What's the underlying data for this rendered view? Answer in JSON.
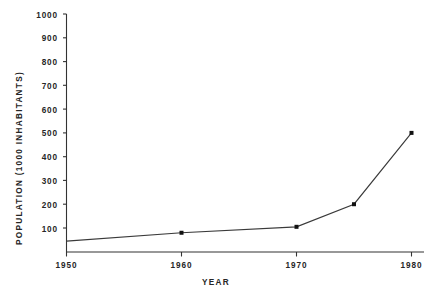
{
  "chart_data": {
    "type": "line",
    "title": "",
    "xlabel": "YEAR",
    "ylabel": "POPULATION  (1000 INHABITANTS)",
    "x": [
      1950,
      1960,
      1970,
      1975,
      1980
    ],
    "values": [
      45,
      80,
      105,
      200,
      500
    ],
    "series": [
      {
        "name": "Population",
        "values": [
          45,
          80,
          105,
          200,
          500
        ]
      }
    ],
    "xlim": [
      1950,
      1980
    ],
    "ylim": [
      0,
      1000
    ],
    "xticks": [
      1950,
      1960,
      1970,
      1980
    ],
    "xtick_labels": [
      "1950",
      "1960",
      "1970",
      "1980"
    ],
    "yticks": [
      100,
      200,
      300,
      400,
      500,
      600,
      700,
      800,
      900,
      1000
    ],
    "ytick_labels": [
      "100",
      "200",
      "300",
      "400",
      "500",
      "600",
      "700",
      "800",
      "900",
      "1000"
    ],
    "grid": false,
    "legend": false,
    "legend_position": "none",
    "marker": "square",
    "line_color": "#3a3a3a",
    "marker_color": "#111111",
    "axis_color": "#333333",
    "background_color": "#ffffff"
  },
  "axes": {
    "y_title": "POPULATION  (1000 INHABITANTS)",
    "x_title": "YEAR"
  },
  "y_ticks": [
    {
      "label": "1000"
    },
    {
      "label": "900"
    },
    {
      "label": "800"
    },
    {
      "label": "700"
    },
    {
      "label": "600"
    },
    {
      "label": "500"
    },
    {
      "label": "400"
    },
    {
      "label": "300"
    },
    {
      "label": "200"
    },
    {
      "label": "100"
    }
  ],
  "x_ticks": [
    {
      "label": "1950"
    },
    {
      "label": "1960"
    },
    {
      "label": "1970"
    },
    {
      "label": "1980"
    }
  ]
}
